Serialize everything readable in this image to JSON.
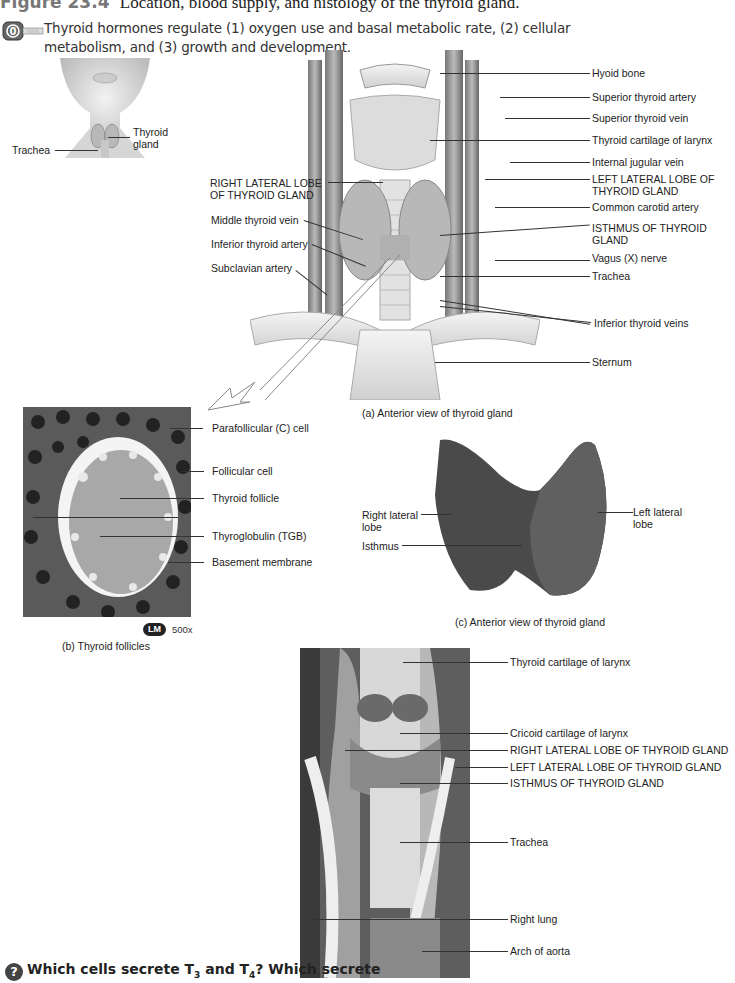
{
  "figure": {
    "number": "Figure 23.4",
    "title": "Location, blood supply, and histology of the thyroid gland."
  },
  "intro": {
    "icon": "functions-key-icon",
    "text": "Thyroid hormones regulate (1) oxygen use and basal metabolic rate, (2) cellular metabolism, and (3) growth and development."
  },
  "inset": {
    "labels": {
      "thyroid_gland": "Thyroid gland",
      "trachea": "Trachea"
    }
  },
  "panel_a": {
    "caption": "(a) Anterior view of thyroid gland",
    "left_labels": [
      "RIGHT LATERAL LOBE OF THYROID GLAND",
      "Middle thyroid vein",
      "Inferior thyroid artery",
      "Subclavian artery"
    ],
    "right_labels": [
      "Hyoid bone",
      "Superior thyroid artery",
      "Superior thyroid vein",
      "Thyroid cartilage of larynx",
      "Internal jugular vein",
      "LEFT LATERAL LOBE OF THYROID GLAND",
      "Common carotid artery",
      "ISTHMUS OF THYROID GLAND",
      "Vagus (X) nerve",
      "Trachea",
      "Inferior thyroid veins",
      "Sternum"
    ]
  },
  "panel_b": {
    "caption": "(b) Thyroid follicles",
    "badge": "LM",
    "magnification": "500x",
    "labels": [
      "Parafollicular (C) cell",
      "Follicular cell",
      "Thyroid follicle",
      "Thyroglobulin (TGB)",
      "Basement membrane"
    ]
  },
  "panel_c": {
    "caption": "(c) Anterior view of thyroid gland",
    "labels": {
      "right_lobe": "Right lateral lobe",
      "isthmus": "Isthmus",
      "left_lobe": "Left lateral lobe"
    }
  },
  "panel_d": {
    "labels": [
      "Thyroid cartilage of larynx",
      "Cricoid cartilage of larynx",
      "RIGHT LATERAL LOBE OF THYROID GLAND",
      "LEFT LATERAL LOBE OF THYROID GLAND",
      "ISTHMUS OF THYROID GLAND",
      "Trachea",
      "Right lung",
      "Arch of aorta"
    ]
  },
  "question": {
    "icon": "question-icon",
    "text_prefix": "Which cells secrete T",
    "sub1": "3",
    "text_mid": " and T",
    "sub2": "4",
    "text_suffix": "? Which secrete"
  }
}
